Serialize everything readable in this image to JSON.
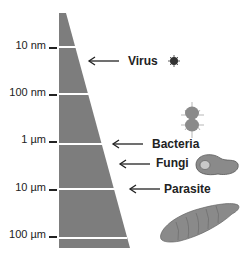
{
  "scale": {
    "ticks": [
      {
        "label": "10 nm",
        "y": 47
      },
      {
        "label": "100 nm",
        "y": 94
      },
      {
        "label": "1 µm",
        "y": 141
      },
      {
        "label": "10 µm",
        "y": 189
      },
      {
        "label": "100 µm",
        "y": 236
      }
    ]
  },
  "organisms": [
    {
      "name": "Virus",
      "icon": "virus-icon",
      "arrow_y": 61
    },
    {
      "name": "Bacteria",
      "icon": "bacteria-icon",
      "arrow_y": 144
    },
    {
      "name": "Fungi",
      "icon": "fungi-icon",
      "arrow_y": 164
    },
    {
      "name": "Parasite",
      "icon": "parasite-icon",
      "arrow_y": 189
    }
  ],
  "colors": {
    "wedge": "#7d7d7d",
    "organism_fill": "#8a8a8a",
    "text": "#222222"
  }
}
